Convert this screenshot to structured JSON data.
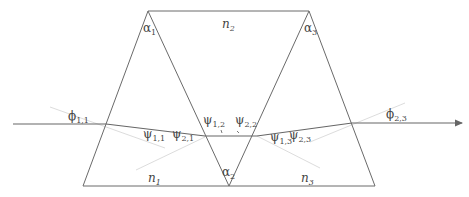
{
  "diagram": {
    "colors": {
      "edge": "#6a6a6a",
      "ray": "#666666",
      "normal": "#d8d8d8",
      "label": "#444444"
    },
    "media": [
      {
        "id": "n1",
        "base": "n",
        "sub": "1"
      },
      {
        "id": "n2",
        "base": "n",
        "sub": "2"
      },
      {
        "id": "n3",
        "base": "n",
        "sub": "3"
      }
    ],
    "apex_angles": [
      {
        "id": "alpha1",
        "base": "α",
        "sub": "1"
      },
      {
        "id": "alpha2",
        "base": "α",
        "sub": "2"
      },
      {
        "id": "alpha3",
        "base": "α",
        "sub": "3"
      }
    ],
    "ray_angles": [
      {
        "id": "phi11",
        "base": "ϕ",
        "sub": "1,1"
      },
      {
        "id": "psi11",
        "base": "ψ",
        "sub": "1,1"
      },
      {
        "id": "psi21",
        "base": "ψ",
        "sub": "2,1"
      },
      {
        "id": "psi12",
        "base": "ψ",
        "sub": "1,2"
      },
      {
        "id": "psi22",
        "base": "ψ",
        "sub": "2,2"
      },
      {
        "id": "psi13",
        "base": "ψ",
        "sub": "1,3"
      },
      {
        "id": "psi23",
        "base": "ψ",
        "sub": "2,3"
      },
      {
        "id": "phi23",
        "base": "ϕ",
        "sub": "2,3"
      }
    ]
  }
}
